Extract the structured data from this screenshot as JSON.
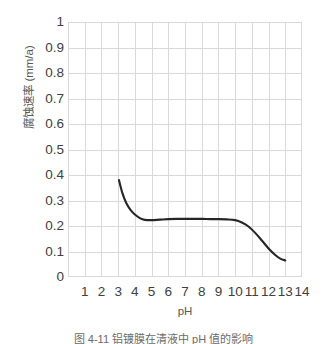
{
  "chart_data": {
    "type": "line",
    "title": "",
    "xlabel": "pH",
    "ylabel": "腐蚀速率 (mm/a)",
    "xlim": [
      0,
      14
    ],
    "ylim": [
      0,
      1
    ],
    "grid": true,
    "legend": null,
    "xticks": [
      "1",
      "2",
      "3",
      "4",
      "5",
      "6",
      "7",
      "8",
      "9",
      "10",
      "11",
      "12",
      "13",
      "14"
    ],
    "xtick_values": [
      1,
      2,
      3,
      4,
      5,
      6,
      7,
      8,
      9,
      10,
      11,
      12,
      13,
      14
    ],
    "yticks": [
      "1",
      "0.9",
      "0.8",
      "0.7",
      "0.6",
      "0.5",
      "0.4",
      "0.3",
      "0.2",
      "0.1",
      "0"
    ],
    "ytick_values": [
      1,
      0.9,
      0.8,
      0.7,
      0.6,
      0.5,
      0.4,
      0.3,
      0.2,
      0.1,
      0
    ],
    "series": [
      {
        "name": "腐蚀速率",
        "color": "#262626",
        "linewidth": 2.1,
        "x": [
          3.05,
          3.25,
          3.5,
          3.75,
          4.0,
          4.3,
          4.6,
          5.0,
          5.5,
          6.0,
          6.5,
          7.0,
          7.5,
          8.0,
          8.5,
          9.0,
          9.5,
          10.0,
          10.4,
          10.8,
          11.2,
          11.6,
          12.0,
          12.4,
          12.7,
          13.0
        ],
        "y": [
          0.38,
          0.33,
          0.288,
          0.262,
          0.245,
          0.231,
          0.224,
          0.223,
          0.225,
          0.227,
          0.228,
          0.228,
          0.228,
          0.228,
          0.227,
          0.227,
          0.226,
          0.223,
          0.214,
          0.198,
          0.173,
          0.143,
          0.112,
          0.086,
          0.072,
          0.065
        ]
      }
    ]
  },
  "caption": {
    "text": "图 4-11  铝镀膜在清液中 pH 值的影响"
  },
  "colors": {
    "grid": "#d9d9d9",
    "axis_text": "#404040",
    "axis_title": "#595959",
    "series": "#262626",
    "background": "#ffffff"
  }
}
